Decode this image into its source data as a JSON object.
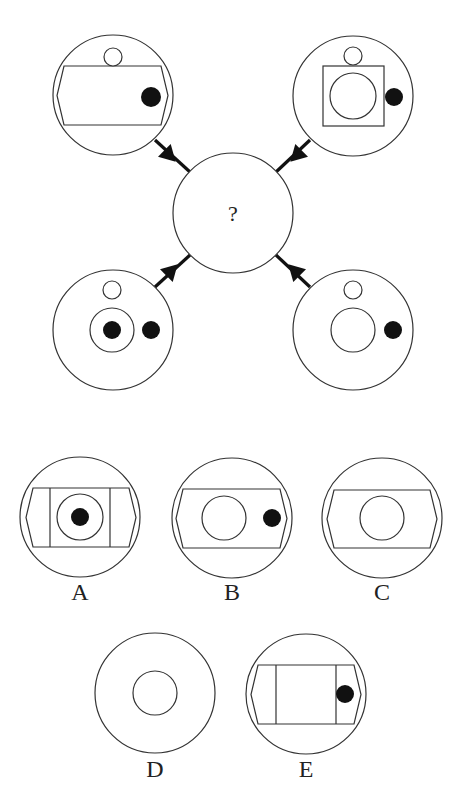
{
  "puzzle": {
    "type": "figure-reasoning",
    "question_mark": "?",
    "stroke_color": "#333333",
    "fill_color": "#111111",
    "background": "#ffffff",
    "clipped_header_text": "",
    "center": {
      "cx": 233,
      "cy": 213,
      "r": 60
    },
    "connectors": [
      {
        "id": "top-left",
        "x1": 155,
        "y1": 140,
        "x2": 190,
        "y2": 172,
        "arrow_x": 170,
        "arrow_y": 156,
        "angle": 45
      },
      {
        "id": "top-right",
        "x1": 310,
        "y1": 140,
        "x2": 276,
        "y2": 172,
        "arrow_x": 296,
        "arrow_y": 156,
        "angle": 135
      },
      {
        "id": "bottom-left",
        "x1": 155,
        "y1": 287,
        "x2": 190,
        "y2": 255,
        "arrow_x": 172,
        "arrow_y": 270,
        "angle": -45
      },
      {
        "id": "bottom-right",
        "x1": 310,
        "y1": 287,
        "x2": 276,
        "y2": 255,
        "arrow_x": 294,
        "arrow_y": 270,
        "angle": -135
      }
    ],
    "stems": [
      {
        "id": "top-left",
        "outer": {
          "cx": 113,
          "cy": 95,
          "r": 60
        },
        "hexagon": {
          "x1": 57,
          "x2": 168,
          "y1": 66,
          "y2": 125,
          "point": 7
        },
        "dividers": [],
        "square": null,
        "small_circle": {
          "cx": 113,
          "cy": 57,
          "r": 9
        },
        "rings": [],
        "dots": [
          {
            "cx": 151,
            "cy": 97,
            "r": 10
          }
        ]
      },
      {
        "id": "top-right",
        "outer": {
          "cx": 353,
          "cy": 96,
          "r": 60
        },
        "hexagon": null,
        "dividers": [],
        "square": {
          "x": 323,
          "y": 66,
          "w": 61,
          "h": 60
        },
        "small_circle": {
          "cx": 353,
          "cy": 56,
          "r": 9
        },
        "rings": [
          {
            "cx": 353,
            "cy": 96,
            "r": 23
          }
        ],
        "dots": [
          {
            "cx": 394,
            "cy": 97,
            "r": 9
          }
        ]
      },
      {
        "id": "bottom-left",
        "outer": {
          "cx": 113,
          "cy": 330,
          "r": 60
        },
        "hexagon": null,
        "dividers": [],
        "square": null,
        "small_circle": {
          "cx": 112,
          "cy": 290,
          "r": 9
        },
        "rings": [
          {
            "cx": 112,
            "cy": 330,
            "r": 22
          }
        ],
        "dots": [
          {
            "cx": 112,
            "cy": 330,
            "r": 9
          },
          {
            "cx": 151,
            "cy": 330,
            "r": 9
          }
        ]
      },
      {
        "id": "bottom-right",
        "outer": {
          "cx": 353,
          "cy": 330,
          "r": 60
        },
        "hexagon": null,
        "dividers": [],
        "square": null,
        "small_circle": {
          "cx": 353,
          "cy": 290,
          "r": 9
        },
        "rings": [
          {
            "cx": 353,
            "cy": 330,
            "r": 22
          }
        ],
        "dots": [
          {
            "cx": 393,
            "cy": 330,
            "r": 9
          }
        ]
      }
    ],
    "options": [
      {
        "label": "A",
        "label_pos": {
          "x": 80,
          "y": 600
        },
        "outer": {
          "cx": 80,
          "cy": 517,
          "r": 60
        },
        "hexagon": {
          "x1": 26,
          "x2": 136,
          "y1": 488,
          "y2": 547,
          "point": 7
        },
        "dividers": [
          50,
          110
        ],
        "square": null,
        "small_circle": null,
        "rings": [
          {
            "cx": 80,
            "cy": 517,
            "r": 23
          }
        ],
        "dots": [
          {
            "cx": 80,
            "cy": 517,
            "r": 9
          }
        ]
      },
      {
        "label": "B",
        "label_pos": {
          "x": 232,
          "y": 600
        },
        "outer": {
          "cx": 232,
          "cy": 518,
          "r": 60
        },
        "hexagon": {
          "x1": 176,
          "x2": 287,
          "y1": 489,
          "y2": 548,
          "point": 7
        },
        "dividers": [],
        "square": null,
        "small_circle": null,
        "rings": [
          {
            "cx": 224,
            "cy": 518,
            "r": 22
          }
        ],
        "dots": [
          {
            "cx": 272,
            "cy": 518,
            "r": 9
          }
        ]
      },
      {
        "label": "C",
        "label_pos": {
          "x": 382,
          "y": 600
        },
        "outer": {
          "cx": 382,
          "cy": 518,
          "r": 60
        },
        "hexagon": {
          "x1": 327,
          "x2": 437,
          "y1": 490,
          "y2": 548,
          "point": 7
        },
        "dividers": [],
        "square": null,
        "small_circle": null,
        "rings": [
          {
            "cx": 382,
            "cy": 518,
            "r": 22
          }
        ],
        "dots": []
      },
      {
        "label": "D",
        "label_pos": {
          "x": 155,
          "y": 777
        },
        "outer": {
          "cx": 155,
          "cy": 693,
          "r": 60
        },
        "hexagon": null,
        "dividers": [],
        "square": null,
        "small_circle": null,
        "rings": [
          {
            "cx": 155,
            "cy": 693,
            "r": 22
          }
        ],
        "dots": []
      },
      {
        "label": "E",
        "label_pos": {
          "x": 306,
          "y": 777
        },
        "outer": {
          "cx": 306,
          "cy": 694,
          "r": 60
        },
        "hexagon": {
          "x1": 251,
          "x2": 361,
          "y1": 665,
          "y2": 724,
          "point": 7
        },
        "dividers": [
          276,
          336
        ],
        "square": null,
        "small_circle": null,
        "rings": [],
        "dots": [
          {
            "cx": 345,
            "cy": 694,
            "r": 9
          }
        ]
      }
    ]
  }
}
